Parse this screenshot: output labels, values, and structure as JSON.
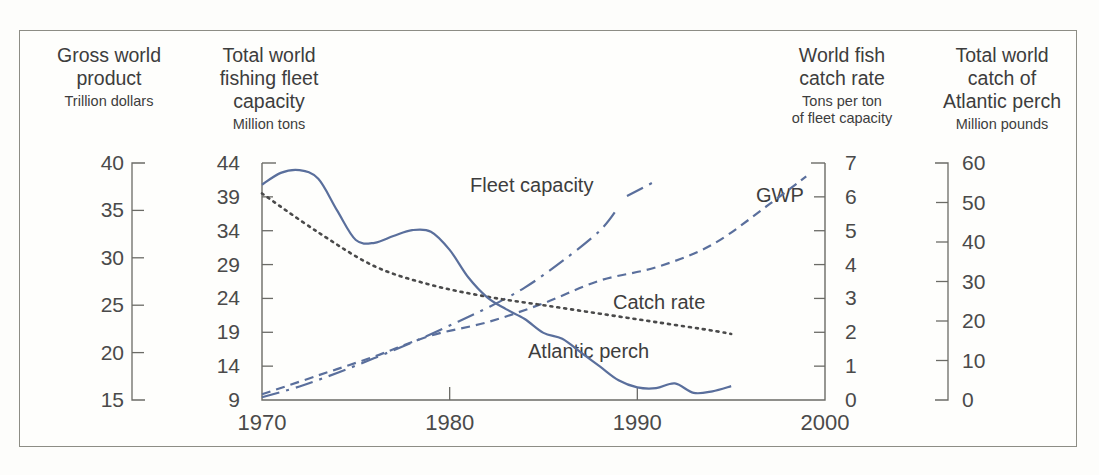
{
  "figure": {
    "background": "#fdfdfb",
    "border_color": "#8d8d85",
    "line_color": "#5a6f9c",
    "axis_color": "#6b6b66",
    "text_color": "#3d3d3d"
  },
  "headers": {
    "gwp": {
      "title_line1": "Gross world",
      "title_line2": "product",
      "units": "Trillion dollars"
    },
    "fleet": {
      "title_line1": "Total world",
      "title_line2": "fishing fleet",
      "title_line3": "capacity",
      "units": "Million tons"
    },
    "catch": {
      "title_line1": "World fish",
      "title_line2": "catch rate",
      "units_line1": "Tons per ton",
      "units_line2": "of fleet capacity"
    },
    "perch": {
      "title_line1": "Total world",
      "title_line2": "catch of",
      "title_line3": "Atlantic perch",
      "units": "Million pounds"
    }
  },
  "chart_data": {
    "type": "line",
    "title": "",
    "xlabel": "",
    "grid": false,
    "legend": "inline-annotations",
    "x": [
      1970,
      1975,
      1980,
      1985,
      1990,
      1995,
      2000
    ],
    "xlim": [
      1970,
      2000
    ],
    "xticks": [
      1970,
      1980,
      1990,
      2000
    ],
    "xtick_labels": [
      "1970",
      "1980",
      "1990",
      "2000"
    ],
    "axes": [
      {
        "id": "gwp-axis",
        "name": "Gross world product",
        "units": "Trillion dollars",
        "side": "outer-left",
        "ticks": [
          40,
          35,
          30,
          25,
          20,
          15
        ],
        "tick_labels": [
          "40",
          "35",
          "30",
          "25",
          "20",
          "15"
        ],
        "range": [
          15,
          40
        ]
      },
      {
        "id": "fleet-axis",
        "name": "Total world fishing fleet capacity",
        "units": "Million tons",
        "side": "left",
        "ticks": [
          44,
          39,
          34,
          29,
          24,
          19,
          14,
          9
        ],
        "tick_labels": [
          "44",
          "39",
          "34",
          "29",
          "24",
          "19",
          "14",
          "9"
        ],
        "range": [
          9,
          44
        ]
      },
      {
        "id": "catchrate-axis",
        "name": "World fish catch rate",
        "units": "Tons per ton of fleet capacity",
        "side": "right",
        "ticks": [
          7,
          6,
          5,
          4,
          3,
          2,
          1,
          0
        ],
        "tick_labels": [
          "7",
          "6",
          "5",
          "4",
          "3",
          "2",
          "1",
          "0"
        ],
        "range": [
          0,
          7
        ]
      },
      {
        "id": "perch-axis",
        "name": "Total world catch of Atlantic perch",
        "units": "Million pounds",
        "side": "outer-right",
        "ticks": [
          60,
          50,
          40,
          30,
          20,
          10,
          0
        ],
        "tick_labels": [
          "60",
          "50",
          "40",
          "30",
          "20",
          "10",
          "0"
        ],
        "range": [
          0,
          60
        ]
      }
    ],
    "series": [
      {
        "name": "Fleet capacity",
        "label": "Fleet capacity",
        "axis": "fleet-axis",
        "units": "Million tons",
        "style": "dash-dot",
        "color": "#5a6f9c",
        "x": [
          1970,
          1972,
          1974,
          1976,
          1978,
          1980,
          1982,
          1984,
          1986,
          1988,
          1989
        ],
        "values": [
          9.4,
          11.0,
          13.0,
          15.2,
          17.5,
          20.0,
          22.6,
          25.6,
          29.5,
          34.0,
          37.5
        ]
      },
      {
        "name": "GWP",
        "label": "GWP",
        "axis": "gwp-axis",
        "units": "Trillion dollars",
        "style": "dashed",
        "color": "#5a6f9c",
        "x": [
          1970,
          1973,
          1976,
          1979,
          1982,
          1985,
          1988,
          1991,
          1994,
          1997,
          1999
        ],
        "values": [
          15.6,
          17.6,
          19.6,
          21.8,
          23.2,
          25.2,
          27.6,
          29.0,
          31.4,
          35.6,
          38.6
        ]
      },
      {
        "name": "Catch rate",
        "label": "Catch rate",
        "axis": "catchrate-axis",
        "units": "Tons per ton of fleet capacity",
        "style": "dotted",
        "color": "#4a4a4a",
        "x": [
          1970,
          1973,
          1976,
          1979,
          1982,
          1985,
          1988,
          1991,
          1994,
          1995
        ],
        "values": [
          6.1,
          4.95,
          3.95,
          3.4,
          3.05,
          2.8,
          2.55,
          2.3,
          2.05,
          1.95
        ]
      },
      {
        "name": "Atlantic perch",
        "label": "Atlantic perch",
        "axis": "perch-axis",
        "units": "Million pounds",
        "style": "solid",
        "color": "#5a6f9c",
        "x": [
          1970,
          1971,
          1972,
          1973,
          1974,
          1975,
          1976,
          1977,
          1978,
          1979,
          1980,
          1981,
          1982,
          1983,
          1984,
          1985,
          1986,
          1987,
          1988,
          1989,
          1990,
          1991,
          1992,
          1993,
          1994,
          1995
        ],
        "values": [
          54.5,
          57.5,
          58.2,
          56.0,
          48.0,
          40.5,
          39.8,
          41.5,
          43.0,
          42.6,
          38.0,
          31.0,
          26.0,
          23.0,
          20.5,
          17.0,
          15.5,
          12.0,
          8.5,
          5.0,
          3.2,
          3.0,
          4.2,
          1.8,
          2.2,
          3.5
        ]
      }
    ],
    "annotations": [
      {
        "text": "Fleet capacity",
        "x_px": 470,
        "y_px": 186
      },
      {
        "text": "GWP",
        "x_px": 756,
        "y_px": 196
      },
      {
        "text": "Catch rate",
        "x_px": 613,
        "y_px": 303
      },
      {
        "text": "Atlantic perch",
        "x_px": 528,
        "y_px": 352
      }
    ]
  }
}
